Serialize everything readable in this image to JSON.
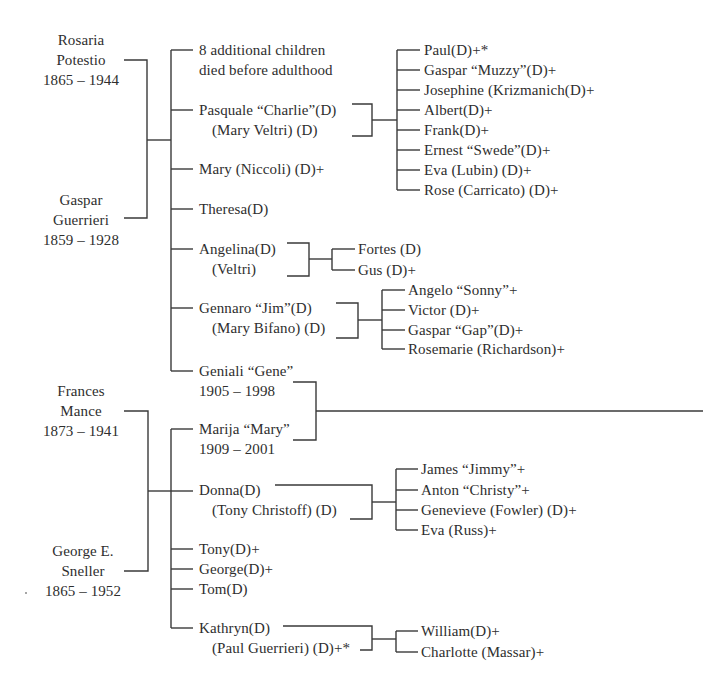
{
  "colors": {
    "ink": "#2e2e2e",
    "line": "#3a3a3a",
    "background": "#ffffff"
  },
  "families": [
    {
      "id": "guerrieri",
      "parents": [
        {
          "name1": "Rosaria",
          "name2": "Potestio",
          "dates": "1865 – 1944"
        },
        {
          "name1": "Gaspar",
          "name2": "Guerrieri",
          "dates": "1859 – 1928"
        }
      ],
      "children": [
        {
          "line1": "8 additional children",
          "line2": "died before adulthood"
        },
        {
          "line1": "Pasquale “Charlie”(D)",
          "line2": "(Mary Veltri) (D)",
          "children": [
            "Paul(D)+*",
            "Gaspar “Muzzy”(D)+",
            "Josephine (Krizmanich(D)+",
            "Albert(D)+",
            "Frank(D)+",
            "Ernest “Swede”(D)+",
            "Eva (Lubin) (D)+",
            "Rose (Carricato) (D)+"
          ]
        },
        {
          "line1": "Mary (Niccoli) (D)+"
        },
        {
          "line1": "Theresa(D)"
        },
        {
          "line1": "Angelina(D)",
          "line2": "(Veltri)",
          "children": [
            "Fortes (D)",
            "Gus (D)+"
          ]
        },
        {
          "line1": "Gennaro “Jim”(D)",
          "line2": "(Mary Bifano) (D)",
          "children": [
            "Angelo “Sonny”+",
            "Victor (D)+",
            "Gaspar “Gap”(D)+",
            "Rosemarie (Richardson)+"
          ]
        },
        {
          "line1": "Geniali “Gene”",
          "line2": "1905 – 1998"
        }
      ]
    },
    {
      "id": "sneller",
      "parents": [
        {
          "name1": "Frances",
          "name2": "Mance",
          "dates": "1873 – 1941"
        },
        {
          "name1": "George E.",
          "name2": "Sneller",
          "dates": "1865 – 1952"
        }
      ],
      "children": [
        {
          "line1": "Marija “Mary”",
          "line2": "1909 – 2001"
        },
        {
          "line1": "Donna(D)",
          "line2": "(Tony Christoff) (D)",
          "children": [
            "James “Jimmy”+",
            "Anton “Christy”+",
            "Genevieve (Fowler) (D)+",
            "Eva (Russ)+"
          ]
        },
        {
          "line1": "Tony(D)+"
        },
        {
          "line1": "George(D)+"
        },
        {
          "line1": "Tom(D)"
        },
        {
          "line1": "Kathryn(D)",
          "line2": "(Paul Guerrieri) (D)+*",
          "children": [
            "William(D)+",
            "Charlotte (Massar)+"
          ]
        }
      ]
    }
  ],
  "union": {
    "spouse1": "Geniali “Gene”",
    "spouse2": "Marija “Mary”",
    "continues": "right"
  }
}
